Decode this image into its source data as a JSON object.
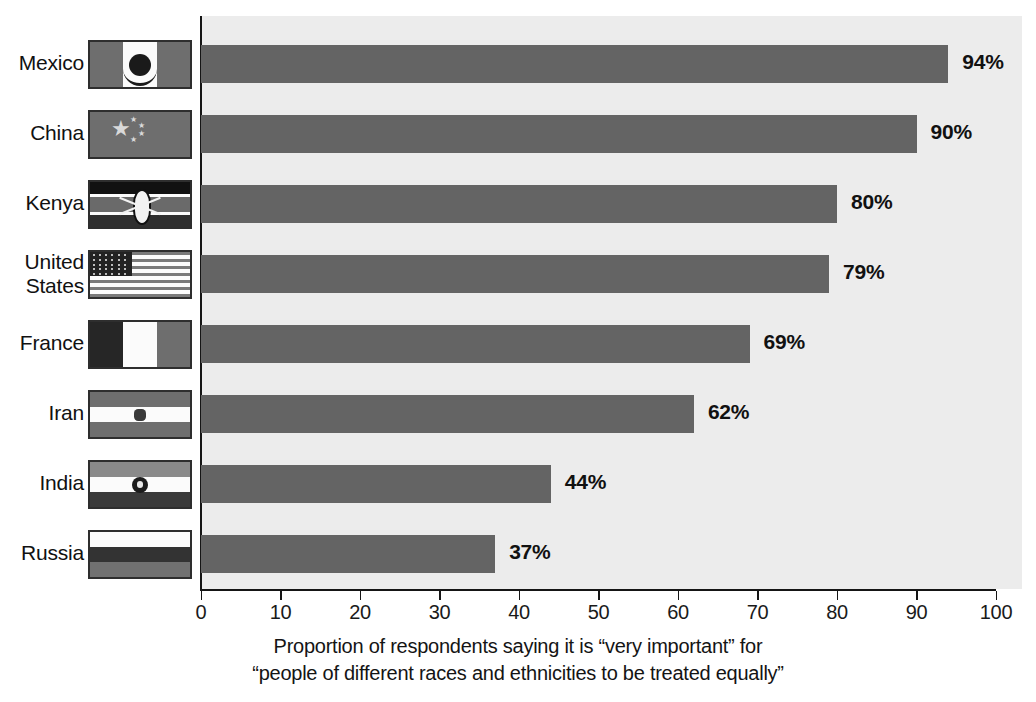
{
  "chart_data": {
    "type": "bar",
    "orientation": "horizontal",
    "title": "",
    "categories": [
      "Mexico",
      "China",
      "Kenya",
      "United States",
      "France",
      "Iran",
      "India",
      "Russia"
    ],
    "values": [
      94,
      90,
      80,
      79,
      69,
      62,
      44,
      37
    ],
    "value_labels": [
      "94%",
      "90%",
      "80%",
      "79%",
      "69%",
      "62%",
      "44%",
      "37%"
    ],
    "xlabel": "",
    "ylabel": "",
    "xlim": [
      0,
      100
    ],
    "xticks": [
      0,
      10,
      20,
      30,
      40,
      50,
      60,
      70,
      80,
      90,
      100
    ],
    "xtick_labels": [
      "0",
      "10",
      "20",
      "30",
      "40",
      "50",
      "60",
      "70",
      "80",
      "90",
      "100"
    ],
    "grid": false,
    "legend": "none",
    "bar_color": "#646464",
    "plot_background": "#ececec",
    "caption_line1": "Proportion of respondents saying it is “very important” for",
    "caption_line2": "“people of different races and ethnicities to be treated equally”"
  },
  "rows": [
    {
      "country": "Mexico",
      "country_line1": "Mexico",
      "country_line2": "",
      "value": 94,
      "value_label": "94%",
      "flag": "mexico-flag"
    },
    {
      "country": "China",
      "country_line1": "China",
      "country_line2": "",
      "value": 90,
      "value_label": "90%",
      "flag": "china-flag"
    },
    {
      "country": "Kenya",
      "country_line1": "Kenya",
      "country_line2": "",
      "value": 80,
      "value_label": "80%",
      "flag": "kenya-flag"
    },
    {
      "country": "United States",
      "country_line1": "United",
      "country_line2": "States",
      "value": 79,
      "value_label": "79%",
      "flag": "united-states-flag"
    },
    {
      "country": "France",
      "country_line1": "France",
      "country_line2": "",
      "value": 69,
      "value_label": "69%",
      "flag": "france-flag"
    },
    {
      "country": "Iran",
      "country_line1": "Iran",
      "country_line2": "",
      "value": 62,
      "value_label": "62%",
      "flag": "iran-flag"
    },
    {
      "country": "India",
      "country_line1": "India",
      "country_line2": "",
      "value": 44,
      "value_label": "44%",
      "flag": "india-flag"
    },
    {
      "country": "Russia",
      "country_line1": "Russia",
      "country_line2": "",
      "value": 37,
      "value_label": "37%",
      "flag": "russia-flag"
    }
  ],
  "axis": {
    "ticks": [
      "0",
      "10",
      "20",
      "30",
      "40",
      "50",
      "60",
      "70",
      "80",
      "90",
      "100"
    ]
  },
  "caption": {
    "line1": "Proportion of respondents saying it is “very important” for",
    "line2": "“people of different races and ethnicities to be treated equally”"
  }
}
